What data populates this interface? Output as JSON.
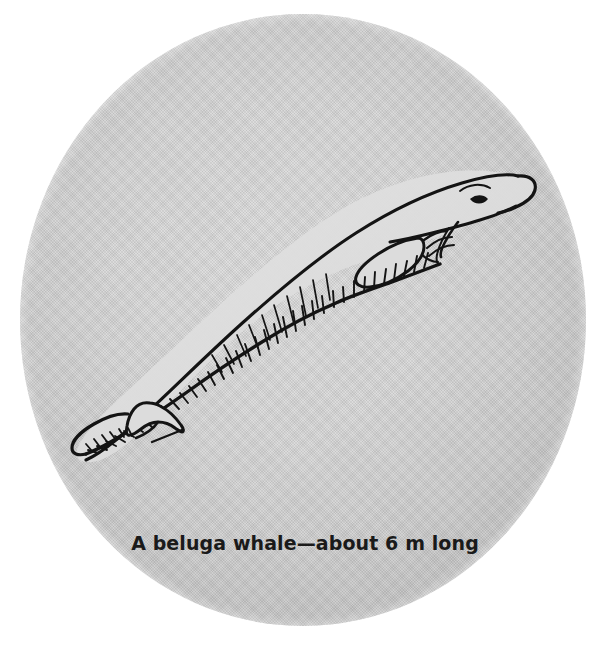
{
  "figure": {
    "name": "beluga-whale-figure",
    "subject": "beluga whale",
    "caption": "A beluga whale—about 6 m long",
    "plate": {
      "shape": "circle",
      "fill_color": "#d2d2d2",
      "edge_color": "#bdbdbd",
      "background_color": "#ffffff"
    },
    "ink": {
      "line_color": "#111111",
      "hatch_color": "#111111"
    },
    "parts": [
      {
        "name": "melon-head",
        "label": "melon"
      },
      {
        "name": "eye",
        "label": "eye"
      },
      {
        "name": "mouth-line",
        "label": "mouth"
      },
      {
        "name": "pectoral-flipper",
        "label": "pectoral flipper"
      },
      {
        "name": "dorsal-ridge",
        "label": "dorsal ridge"
      },
      {
        "name": "tail-stock",
        "label": "tail stock"
      },
      {
        "name": "tail-flukes",
        "label": "tail flukes"
      },
      {
        "name": "belly-hatching",
        "label": "belly shading"
      }
    ],
    "measurement": {
      "value": "6",
      "unit": "m",
      "descriptor": "about 6 m long"
    }
  }
}
